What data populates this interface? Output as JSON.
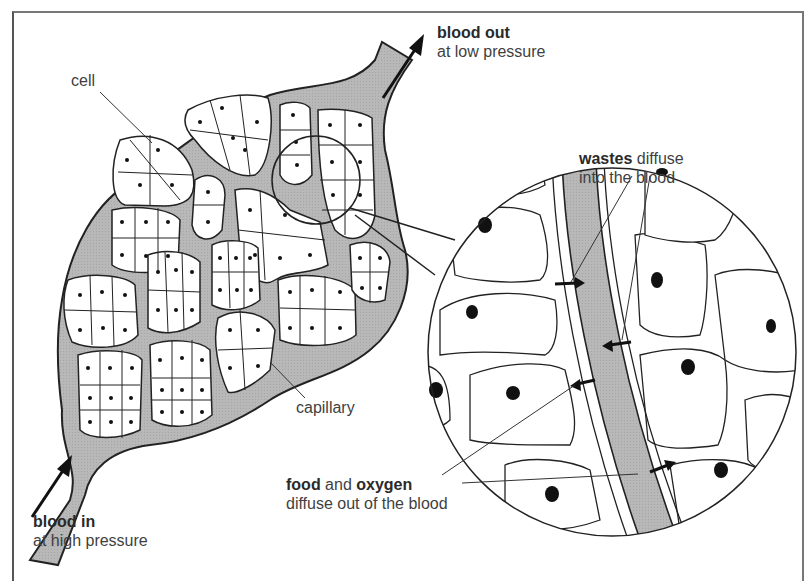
{
  "diagram": {
    "labels": {
      "blood_out": {
        "bold": "blood out",
        "rest": "at low pressure"
      },
      "blood_in": {
        "bold": "blood in",
        "rest": "at high pressure"
      },
      "cell": "cell",
      "capillary": "capillary",
      "wastes": {
        "bold": "wastes",
        "rest1": " diffuse",
        "rest2": "into the blood"
      },
      "food_oxygen": {
        "bold1": "food",
        "mid": " and ",
        "bold2": "oxygen",
        "rest": "diffuse out of the blood"
      }
    },
    "colors": {
      "blood": "#b4b4b4",
      "outline": "#222222",
      "cell_fill": "#ffffff",
      "text": "#3f3f3f"
    },
    "arrows": {
      "flow_in": "up-right",
      "flow_out": "up-right",
      "wastes_into_blood": 2,
      "food_oxygen_out_of_blood": 2
    }
  }
}
